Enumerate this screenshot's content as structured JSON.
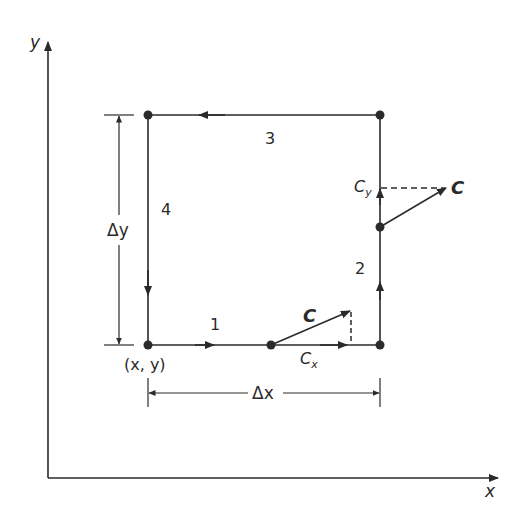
{
  "figure": {
    "axes": {
      "x_label": "x",
      "y_label": "y"
    },
    "contour": {
      "corner_label": "(x, y)",
      "segments": [
        {
          "id": 1,
          "label": "1",
          "direction": "right"
        },
        {
          "id": 2,
          "label": "2",
          "direction": "up"
        },
        {
          "id": 3,
          "label": "3",
          "direction": "left"
        },
        {
          "id": 4,
          "label": "4",
          "direction": "down"
        }
      ]
    },
    "dimensions": {
      "dx_label": "Δx",
      "dy_label": "Δy"
    },
    "vectors": {
      "bottom": {
        "vector_label": "C",
        "component_label": "Cx",
        "component_sub": "x",
        "component_base": "C"
      },
      "right": {
        "vector_label": "C",
        "component_label": "Cy",
        "component_sub": "y",
        "component_base": "C"
      }
    },
    "colors": {
      "ink": "#2a2a2a",
      "background": "#ffffff"
    }
  }
}
